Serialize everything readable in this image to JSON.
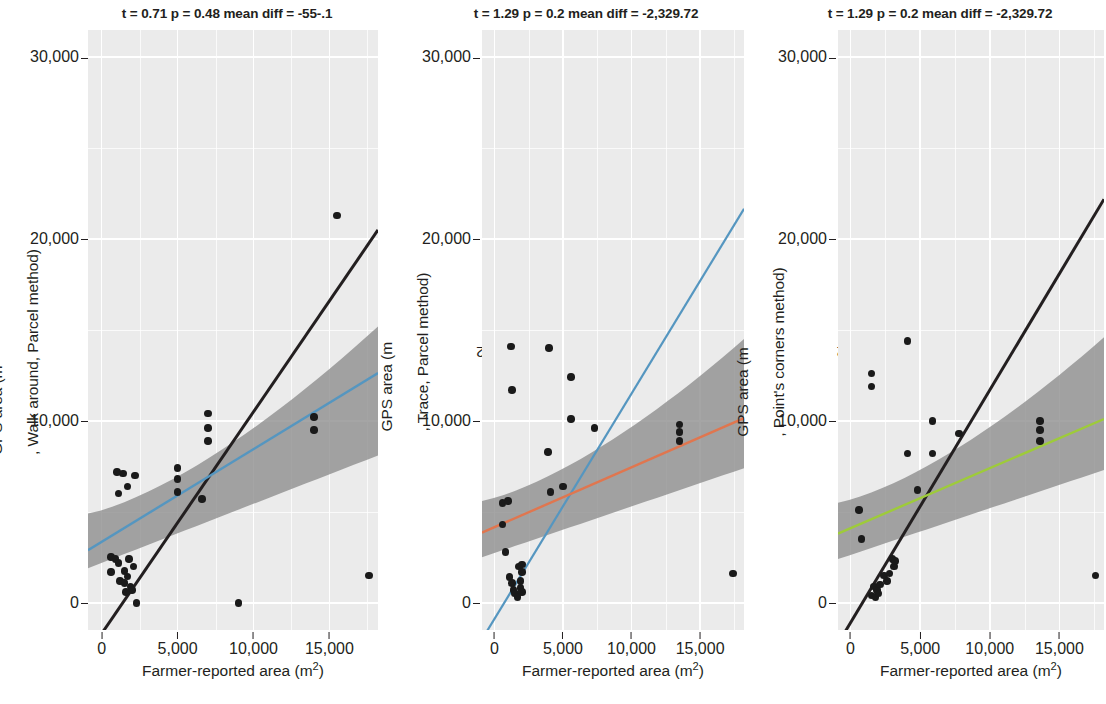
{
  "figure": {
    "background": "#ffffff",
    "panel_background": "#ebebeb",
    "grid_color": "#ffffff",
    "point_color": "#1a1a1a",
    "band_color": "#8c8c8c",
    "identity_line_color": "#231f20"
  },
  "axes": {
    "x": {
      "label": "Farmer-reported area (m²)",
      "ticks": [
        "0",
        "5,000",
        "10,000",
        "15,000"
      ],
      "tick_values": [
        0,
        5000,
        10000,
        15000
      ],
      "min": -900,
      "max": 18200
    },
    "y": {
      "ticks": [
        "0-",
        "10,000-",
        "20,000-",
        "30,000-"
      ],
      "tick_labels": [
        "0",
        "10,000",
        "20,000",
        "30,000"
      ],
      "tick_values": [
        0,
        10000,
        20000,
        30000
      ],
      "min": -1500,
      "max": 31500
    }
  },
  "panels": [
    {
      "id": "walk-around-parcel",
      "title": "t = 0.71 p = 0.48 mean diff = -55-.1",
      "ylabel": "GPS area (m², Walk around, Parcel method)",
      "xlabel": "Farmer-reported area (m²)",
      "regression_color": "#5596c0",
      "regression": {
        "intercept": 3350,
        "slope": 0.51
      },
      "identity": {
        "intercept": -1700,
        "slope": 1.22
      },
      "band": {
        "lo_at_xmin": 1900,
        "hi_at_xmin": 4900,
        "lo_at_xmax": 8100,
        "hi_at_xmax": 15200
      }
    },
    {
      "id": "trace-parcel",
      "title": "t = 1.29 p = 0.2 mean diff = -2,329.72",
      "ylabel": "GPS area (m², Trace, Parcel method)",
      "xlabel": "Farmer-reported area (m²)",
      "regression_color": "#e0764f",
      "regression": {
        "intercept": 4150,
        "slope": 0.33
      },
      "identity": {
        "intercept": -900,
        "slope": 1.24
      },
      "identity_color": "#5596c0",
      "band": {
        "lo_at_xmin": 2500,
        "hi_at_xmin": 5600,
        "lo_at_xmax": 7400,
        "hi_at_xmax": 14500
      }
    },
    {
      "id": "points-corners",
      "title": "t = 1.29 p = 0.2 mean diff = -2,329.72",
      "ylabel": "GPS area (m², Point's corners method)",
      "xlabel": "Farmer-reported area (m²)",
      "regression_color": "#9ecb3a",
      "regression": {
        "intercept": 4100,
        "slope": 0.33
      },
      "identity": {
        "intercept": -1100,
        "slope": 1.28
      },
      "identity_color": "#231f20",
      "band": {
        "lo_at_xmin": 2400,
        "hi_at_xmin": 5500,
        "lo_at_xmax": 7300,
        "hi_at_xmax": 14600
      }
    }
  ],
  "chart_data": {
    "type": "scatter",
    "xlabel": "Farmer-reported area (m²)",
    "xlim": [
      -900,
      18200
    ],
    "ylim": [
      -1500,
      31500
    ],
    "xticks": [
      0,
      5000,
      10000,
      15000
    ],
    "yticks": [
      0,
      10000,
      20000,
      30000
    ],
    "grid": true,
    "legend": "none",
    "panels": [
      {
        "name": "Walk around, Parcel method",
        "ylabel": "GPS area (m², Walk around, Parcel method)",
        "annotation": "t = 0.71 p = 0.48 mean diff = -55-.1",
        "stats": {
          "t": 0.71,
          "p": 0.48,
          "mean_diff": -55.1
        },
        "fit_line_color": "#5596c0",
        "reference_line_color": "#231f20",
        "points": [
          [
            15500,
            21300
          ],
          [
            7000,
            10400
          ],
          [
            7000,
            9600
          ],
          [
            7000,
            8900
          ],
          [
            14000,
            10200
          ],
          [
            14000,
            9500
          ],
          [
            1000,
            7200
          ],
          [
            1400,
            7100
          ],
          [
            2200,
            7000
          ],
          [
            1700,
            6400
          ],
          [
            1100,
            6000
          ],
          [
            5000,
            7400
          ],
          [
            5000,
            6800
          ],
          [
            5000,
            6100
          ],
          [
            6600,
            5700
          ],
          [
            600,
            2500
          ],
          [
            900,
            2400
          ],
          [
            1100,
            2200
          ],
          [
            600,
            1700
          ],
          [
            1500,
            1750
          ],
          [
            1800,
            2400
          ],
          [
            2100,
            2000
          ],
          [
            1200,
            1200
          ],
          [
            1500,
            1100
          ],
          [
            1700,
            1450
          ],
          [
            1900,
            900
          ],
          [
            2000,
            700
          ],
          [
            1600,
            600
          ],
          [
            2300,
            0
          ],
          [
            9000,
            0
          ],
          [
            17600,
            1500
          ]
        ]
      },
      {
        "name": "Trace, Parcel method",
        "ylabel": "GPS area (m², Trace, Parcel method)",
        "annotation": "t = 1.29 p = 0.2 mean diff = -2,329.72",
        "stats": {
          "t": 1.29,
          "p": 0.2,
          "mean_diff": -2329.72
        },
        "fit_line_color": "#e0764f",
        "reference_line_color": "#5596c0",
        "points": [
          [
            1200,
            14100
          ],
          [
            4000,
            14000
          ],
          [
            1300,
            11700
          ],
          [
            5600,
            12400
          ],
          [
            5600,
            10100
          ],
          [
            7300,
            9600
          ],
          [
            13500,
            9800
          ],
          [
            13500,
            9400
          ],
          [
            13500,
            8900
          ],
          [
            3900,
            8300
          ],
          [
            4100,
            6100
          ],
          [
            5000,
            6400
          ],
          [
            600,
            5500
          ],
          [
            1000,
            5600
          ],
          [
            600,
            4300
          ],
          [
            800,
            2800
          ],
          [
            1800,
            2000
          ],
          [
            2000,
            2100
          ],
          [
            2000,
            1700
          ],
          [
            1100,
            1400
          ],
          [
            1300,
            1100
          ],
          [
            1900,
            1200
          ],
          [
            1400,
            700
          ],
          [
            1900,
            800
          ],
          [
            1500,
            500
          ],
          [
            1700,
            300
          ],
          [
            2000,
            600
          ],
          [
            17400,
            1600
          ]
        ]
      },
      {
        "name": "Point's corners method",
        "ylabel": "GPS area (m², Point's corners method)",
        "annotation": "t = 1.29 p = 0.2 mean diff = -2,329.72",
        "stats": {
          "t": 1.29,
          "p": 0.2,
          "mean_diff": -2329.72
        },
        "fit_line_color": "#9ecb3a",
        "reference_line_color": "#231f20",
        "points": [
          [
            4100,
            14400
          ],
          [
            1500,
            12600
          ],
          [
            1500,
            11900
          ],
          [
            5900,
            10000
          ],
          [
            13600,
            10000
          ],
          [
            13600,
            9500
          ],
          [
            13600,
            8900
          ],
          [
            7800,
            9300
          ],
          [
            5900,
            8200
          ],
          [
            4100,
            8200
          ],
          [
            4800,
            6200
          ],
          [
            600,
            5100
          ],
          [
            800,
            3500
          ],
          [
            3000,
            2400
          ],
          [
            3100,
            2000
          ],
          [
            3200,
            2300
          ],
          [
            2400,
            1500
          ],
          [
            2600,
            1200
          ],
          [
            2800,
            1600
          ],
          [
            1700,
            900
          ],
          [
            1900,
            700
          ],
          [
            2100,
            1000
          ],
          [
            1500,
            400
          ],
          [
            1800,
            300
          ],
          [
            2000,
            500
          ],
          [
            17600,
            1500
          ]
        ]
      }
    ]
  }
}
